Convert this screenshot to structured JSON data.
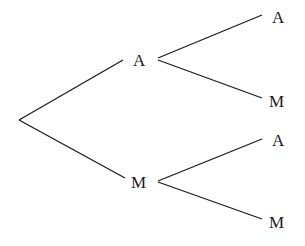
{
  "tree": {
    "level1": [
      {
        "label": "A"
      },
      {
        "label": "M"
      }
    ],
    "level2": [
      {
        "parent": "A",
        "label": "A"
      },
      {
        "parent": "A",
        "label": "M"
      },
      {
        "parent": "M",
        "label": "A"
      },
      {
        "parent": "M",
        "label": "M"
      }
    ]
  },
  "colors": {
    "line": "#1a1a1a",
    "background": "#ffffff"
  }
}
